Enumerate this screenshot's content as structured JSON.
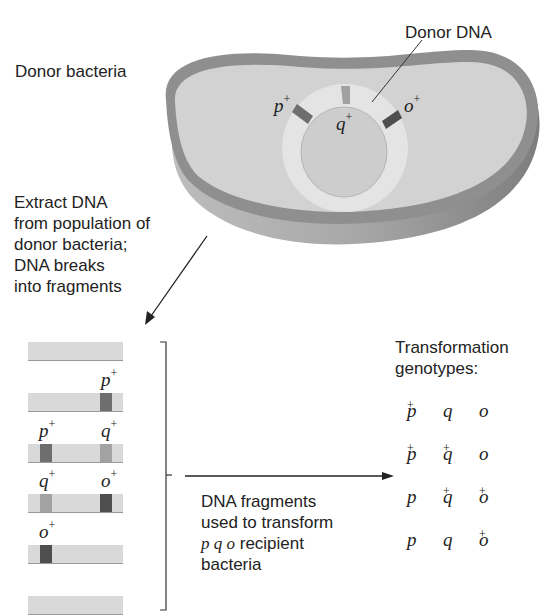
{
  "labels": {
    "donor_bacteria": "Donor bacteria",
    "donor_dna": "Donor DNA",
    "extract_dna": [
      "Extract DNA",
      "from population of",
      "donor bacteria;",
      "DNA breaks",
      "into fragments"
    ],
    "fragments_used": [
      "DNA fragments",
      "used to transform"
    ],
    "recipient_genes": "p q o",
    "recipient_suffix": " recipient",
    "recipient_last": "bacteria",
    "transformation_title": [
      "Transformation",
      "genotypes:"
    ]
  },
  "chromosome_markers": {
    "p": {
      "gene": "p",
      "sup": "+"
    },
    "q": {
      "gene": "q",
      "sup": "+"
    },
    "o": {
      "gene": "o",
      "sup": "+"
    }
  },
  "fragments": [
    {
      "markers": []
    },
    {
      "markers": [
        {
          "gene": "p",
          "sup": "+",
          "pos": "right"
        }
      ]
    },
    {
      "markers": [
        {
          "gene": "p",
          "sup": "+",
          "pos": "left"
        },
        {
          "gene": "q",
          "sup": "+",
          "pos": "right"
        }
      ]
    },
    {
      "markers": [
        {
          "gene": "q",
          "sup": "+",
          "pos": "left"
        },
        {
          "gene": "o",
          "sup": "+",
          "pos": "right"
        }
      ]
    },
    {
      "markers": [
        {
          "gene": "o",
          "sup": "+",
          "pos": "left"
        }
      ]
    },
    {
      "markers": []
    }
  ],
  "genotypes": [
    [
      {
        "g": "p",
        "s": "+"
      },
      {
        "g": "q",
        "s": ""
      },
      {
        "g": "o",
        "s": ""
      }
    ],
    [
      {
        "g": "p",
        "s": "+"
      },
      {
        "g": "q",
        "s": "+"
      },
      {
        "g": "o",
        "s": ""
      }
    ],
    [
      {
        "g": "p",
        "s": ""
      },
      {
        "g": "q",
        "s": "+"
      },
      {
        "g": "o",
        "s": "+"
      }
    ],
    [
      {
        "g": "p",
        "s": ""
      },
      {
        "g": "q",
        "s": ""
      },
      {
        "g": "o",
        "s": "+"
      }
    ]
  ],
  "colors": {
    "cell_outer": "#8f8f8f",
    "cell_fill": "#cfcfcf",
    "cell_side": "#a5a5a5",
    "dna_ring": "#e3e3e3",
    "band_p": "#6e6e6e",
    "band_q": "#a2a2a2",
    "band_o": "#4f4f4f",
    "fragment": "#d9d9d9"
  }
}
